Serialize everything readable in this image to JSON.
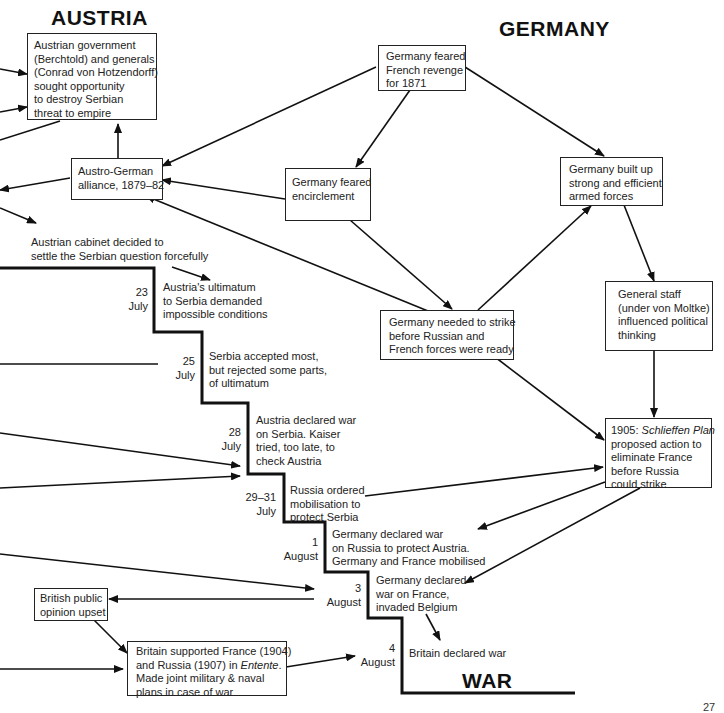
{
  "headings": {
    "austria": "AUSTRIA",
    "germany": "GERMANY",
    "war": "WAR"
  },
  "boxes": {
    "austrian_government": [
      "Austrian government",
      "(Berchtold) and generals",
      "(Conrad von Hotzendorff)",
      "sought opportunity",
      "to destroy Serbian",
      "threat to empire"
    ],
    "austro_german_alliance": [
      "Austro-German",
      "alliance, 1879–82"
    ],
    "germany_feared_revenge": [
      "Germany feared",
      "French revenge",
      "for 1871"
    ],
    "germany_feared_encirclement": [
      "Germany feared",
      "encirclement"
    ],
    "germany_built_forces": [
      "Germany built up",
      "strong and efficient",
      "armed forces"
    ],
    "general_staff": [
      "General staff",
      "(under von Moltke)",
      "influenced political",
      "thinking"
    ],
    "germany_needed_strike": [
      "Germany needed to strike",
      "before Russian and",
      "French forces were ready"
    ],
    "schlieffen": {
      "year": "1905: ",
      "plan_name": "Schlieffen Plan",
      "lines": [
        "proposed action to",
        "eliminate France",
        "before Russia",
        "could strike"
      ]
    },
    "british_public": [
      "British public",
      "opinion upset"
    ],
    "britain_entente": {
      "line1": "Britain supported France (1904)",
      "line2_prefix": "and Russia (1907) in ",
      "line2_italic": "Entente",
      "line2_suffix": ".",
      "line3": "Made joint military & naval",
      "line4": "plans in case of war"
    }
  },
  "timeline": [
    {
      "day": "",
      "month": "",
      "event": [
        "Austrian cabinet decided to",
        "settle the Serbian question forcefully"
      ]
    },
    {
      "day": "23",
      "month": "July",
      "event": [
        "Austria's ultimatum",
        "to Serbia demanded",
        "impossible conditions"
      ]
    },
    {
      "day": "25",
      "month": "July",
      "event": [
        "Serbia accepted most,",
        "but rejected some parts,",
        "of ultimatum"
      ]
    },
    {
      "day": "28",
      "month": "July",
      "event": [
        "Austria declared war",
        "on Serbia. Kaiser",
        "tried, too late, to",
        "check Austria"
      ]
    },
    {
      "day": "29–31",
      "month": "July",
      "event": [
        "Russia ordered",
        "mobilisation to",
        "protect Serbia"
      ]
    },
    {
      "day": "1",
      "month": "August",
      "event": [
        "Germany declared war",
        "on Russia to protect Austria.",
        "Germany and France mobilised"
      ]
    },
    {
      "day": "3",
      "month": "August",
      "event": [
        "Germany declared",
        "war on France,",
        "invaded Belgium"
      ]
    },
    {
      "day": "4",
      "month": "August",
      "event": [
        "Britain declared war"
      ]
    }
  ],
  "page_number": "27",
  "colors": {
    "ink": "#1a1a1a",
    "background": "#ffffff"
  }
}
